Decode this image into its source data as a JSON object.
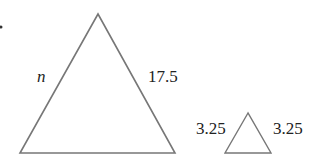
{
  "diagram": {
    "type": "similar-triangles",
    "large_triangle": {
      "vertices": [
        [
          98,
          14
        ],
        [
          20,
          153
        ],
        [
          175,
          153
        ]
      ],
      "left_side_label": "n",
      "right_side_label": "17.5"
    },
    "small_triangle": {
      "vertices": [
        [
          248,
          113
        ],
        [
          225,
          153
        ],
        [
          271,
          153
        ]
      ],
      "left_side_label": "3.25",
      "right_side_label": "3.25"
    },
    "stroke_color": "#777777"
  }
}
